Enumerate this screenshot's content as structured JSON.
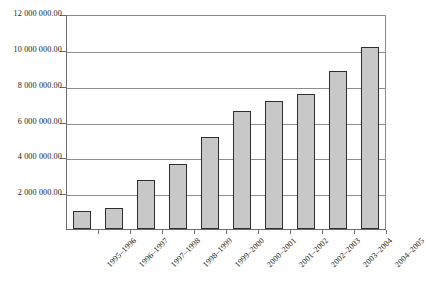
{
  "chart_data": {
    "type": "bar",
    "title": "",
    "subtitle": "",
    "xlabel": "",
    "ylabel": "",
    "categories": [
      "1995–1996",
      "1996–1997",
      "1997–1998",
      "1998–1999",
      "1999–2000",
      "2000–2001",
      "2001–2002",
      "2002–2003",
      "2003–2004",
      "2004–2005"
    ],
    "values": [
      1020000,
      1170000,
      2750000,
      3650000,
      5150000,
      6600000,
      7150000,
      7550000,
      8800000,
      10150000
    ],
    "ylim": [
      0,
      12000000
    ],
    "ytick_values": [
      0,
      2000000,
      4000000,
      6000000,
      8000000,
      10000000,
      12000000
    ],
    "ytick_labels": [
      "",
      "2 000 000.00",
      "4 000 000.00",
      "6 000 000.00",
      "8 000 000.00",
      "10 000 000.00",
      "12 000 000.00"
    ],
    "grid": true,
    "grid_axis": "y",
    "legend": false,
    "legend_position": "none",
    "bar_fill_color": "#c8c8c8",
    "bar_border_color": "#2e2e2e",
    "gridline_color": "#8d8d8d",
    "axis_color": "#6b6b6b",
    "plot_background": "#ffffff",
    "xtick_label_rotation": -45
  }
}
